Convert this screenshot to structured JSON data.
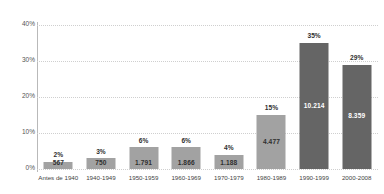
{
  "chart_data": {
    "type": "bar",
    "title": "",
    "subtitle": "",
    "xlabel": "",
    "ylabel": "",
    "ylim": [
      0,
      40
    ],
    "y_tick_labels": [
      "0%",
      "10%",
      "20%",
      "30%",
      "40%"
    ],
    "y_ticks": [
      0,
      10,
      20,
      30,
      40
    ],
    "grid": "horizontal-dotted",
    "legend": "none",
    "categories": [
      "Antes de 1940",
      "1940-1949",
      "1950-1959",
      "1960-1969",
      "1970-1979",
      "1980-1989",
      "1990-1999",
      "2000-2008"
    ],
    "values": [
      2,
      3,
      6,
      6,
      4,
      15,
      35,
      29
    ],
    "percent_labels": [
      "2%",
      "3%",
      "6%",
      "6%",
      "4%",
      "15%",
      "35%",
      "29%"
    ],
    "count_labels": [
      "567",
      "750",
      "1.791",
      "1.866",
      "1.188",
      "4.477",
      "10.214",
      "8.359"
    ],
    "counts": [
      567,
      750,
      1791,
      1866,
      1188,
      4477,
      10214,
      8359
    ],
    "bar_colors": [
      "#a2a2a2",
      "#a2a2a2",
      "#a2a2a2",
      "#a2a2a2",
      "#a2a2a2",
      "#a2a2a2",
      "#656565",
      "#656565"
    ],
    "colors": {
      "light_bar": "#a2a2a2",
      "dark_bar": "#656565",
      "gridline": "#cfcfcf",
      "axis": "#b9b9b9",
      "text": "#3b3b3b",
      "value_on_light": "#2f2f2f",
      "value_on_dark": "#ffffff",
      "background": "#ffffff"
    }
  }
}
